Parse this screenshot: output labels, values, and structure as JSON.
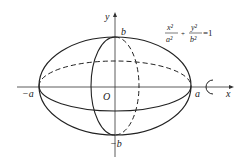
{
  "figure": {
    "equation": {
      "term1_num": "x²",
      "term1_den": "a²",
      "plus": "+",
      "term2_num": "y²",
      "term2_den": "b²",
      "rhs": "=1"
    },
    "axes": {
      "x_label": "x",
      "y_label": "y",
      "origin_label": "O"
    },
    "points": {
      "pos_a": "a",
      "neg_a": "−a",
      "pos_b": "b",
      "neg_b": "−b"
    },
    "rotation_symbol": "rotation-arrow",
    "colors": {
      "stroke": "#222222",
      "background": "#ffffff"
    }
  }
}
